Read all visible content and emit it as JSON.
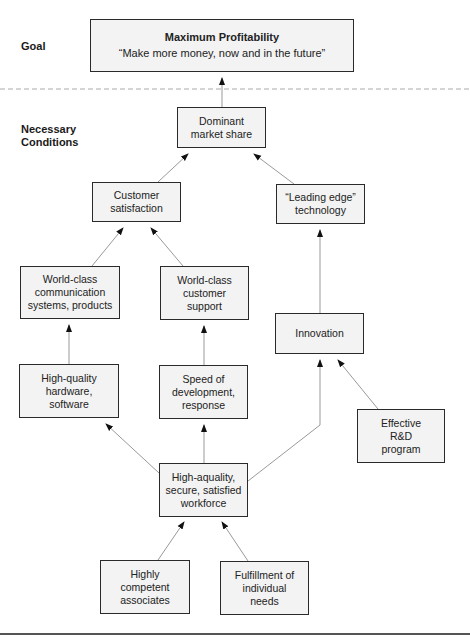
{
  "sections": {
    "goal_label": "Goal",
    "conditions_label": "Necessary\nConditions"
  },
  "goal": {
    "title": "Maximum Profitability",
    "subtitle": "“Make more money, now and in the future”"
  },
  "nodes": {
    "dominant": "Dominant\nmarket share",
    "customer_satisfaction": "Customer\nsatisfaction",
    "leading_edge": "“Leading edge”\ntechnology",
    "world_class_comm": "World-class\ncommunication\nsystems, products",
    "world_class_support": "World-class\ncustomer\nsupport",
    "innovation": "Innovation",
    "high_quality_hw": "High-quality\nhardware,\nsoftware",
    "speed": "Speed of\ndevelopment,\nresponse",
    "rnd": "Effective\nR&D\nprogram",
    "workforce": "High-aquality,\nsecure, satisfied\nworkforce",
    "competent": "Highly\ncompetent\nassociates",
    "fulfillment": "Fulfillment of\nindividual\nneeds"
  },
  "edges": [
    [
      "dominant",
      "goal"
    ],
    [
      "customer_satisfaction",
      "dominant"
    ],
    [
      "leading_edge",
      "dominant"
    ],
    [
      "world_class_comm",
      "customer_satisfaction"
    ],
    [
      "world_class_support",
      "customer_satisfaction"
    ],
    [
      "innovation",
      "leading_edge"
    ],
    [
      "high_quality_hw",
      "world_class_comm"
    ],
    [
      "speed",
      "world_class_support"
    ],
    [
      "rnd",
      "innovation"
    ],
    [
      "workforce",
      "high_quality_hw"
    ],
    [
      "workforce",
      "speed"
    ],
    [
      "workforce",
      "innovation"
    ],
    [
      "competent",
      "workforce"
    ],
    [
      "fulfillment",
      "workforce"
    ]
  ],
  "colors": {
    "box_fill": "#f3f3f3",
    "box_border": "#2a2a2a",
    "line": "#888888"
  }
}
